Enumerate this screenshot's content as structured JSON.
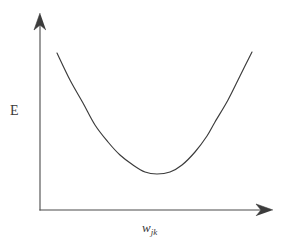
{
  "figure": {
    "background_color": "#ffffff",
    "width": 284,
    "height": 249,
    "stroke_color": "#3b3b3b",
    "axis_color": "#4a4a4a"
  },
  "labels": {
    "y_axis": "E",
    "x_axis_base": "w",
    "x_axis_subscript": "jk"
  },
  "chart_data": {
    "type": "line",
    "title": "",
    "subtitle": "",
    "xlabel": "w_jk",
    "ylabel": "E",
    "annotations": [],
    "grid": false,
    "legend": null,
    "axes": {
      "x_axis": {
        "arrow": true,
        "arrow_direction": "right",
        "ticks": [],
        "tick_labels": [],
        "origin_px": [
          40,
          210
        ],
        "end_px": [
          272,
          210
        ]
      },
      "y_axis": {
        "arrow": true,
        "arrow_direction": "up",
        "ticks": [],
        "tick_labels": [],
        "origin_px": [
          40,
          210
        ],
        "end_px": [
          40,
          14
        ]
      }
    },
    "series": [
      {
        "name": "error-curve",
        "shape": "parabola",
        "description": "convex U-shaped error curve with a single minimum",
        "color": "#3b3b3b",
        "minimum_px": [
          157,
          174
        ],
        "points_px": [
          [
            57,
            53
          ],
          [
            70,
            80
          ],
          [
            83,
            103
          ],
          [
            95,
            125
          ],
          [
            108,
            142
          ],
          [
            120,
            155
          ],
          [
            133,
            165
          ],
          [
            145,
            172
          ],
          [
            157,
            174
          ],
          [
            170,
            172
          ],
          [
            182,
            165
          ],
          [
            195,
            152
          ],
          [
            207,
            136
          ],
          [
            215,
            122
          ],
          [
            228,
            100
          ],
          [
            240,
            76
          ],
          [
            252,
            52
          ]
        ]
      }
    ]
  }
}
